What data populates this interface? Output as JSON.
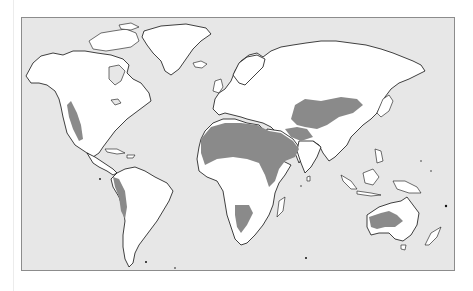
{
  "map": {
    "type": "world-map",
    "subject": "world desert regions",
    "colors": {
      "ocean": "#e7e7e7",
      "land": "#ffffff",
      "desert": "#8a8a8a",
      "coastline": "#111111",
      "frame": "#8c8c8c"
    },
    "desert_regions": [
      {
        "name": "North American deserts (Great Basin / Mojave / Sonoran)"
      },
      {
        "name": "Atacama / Peruvian coastal desert"
      },
      {
        "name": "Sahara"
      },
      {
        "name": "Arabian Desert"
      },
      {
        "name": "Iranian / Thar deserts"
      },
      {
        "name": "Central Asian deserts (Karakum / Kyzylkum / Taklamakan / Gobi)"
      },
      {
        "name": "Kalahari / Namib"
      },
      {
        "name": "Australian deserts"
      }
    ]
  }
}
